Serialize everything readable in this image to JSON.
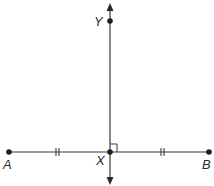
{
  "diagram": {
    "type": "geometry-perpendicular-bisector",
    "colors": {
      "stroke": "#3a3a3a",
      "point": "#1e1e1e",
      "label": "#2a2a2a"
    },
    "points": [
      {
        "id": "A",
        "label": "A",
        "x": 9,
        "y": 152
      },
      {
        "id": "X",
        "label": "X",
        "x": 110,
        "y": 152
      },
      {
        "id": "B",
        "label": "B",
        "x": 209,
        "y": 152
      },
      {
        "id": "Y",
        "label": "Y",
        "x": 110,
        "y": 21
      }
    ],
    "segments": [
      {
        "from": "A",
        "to": "B",
        "name": "segment-AB"
      }
    ],
    "lines": [
      {
        "name": "line-XY",
        "through": [
          "X",
          "Y"
        ],
        "arrows": "both"
      }
    ],
    "marks": {
      "congruence_ticks": [
        {
          "segment": "AX",
          "count": 2
        },
        {
          "segment": "XB",
          "count": 2
        }
      ],
      "right_angle": {
        "at": "X"
      }
    }
  }
}
